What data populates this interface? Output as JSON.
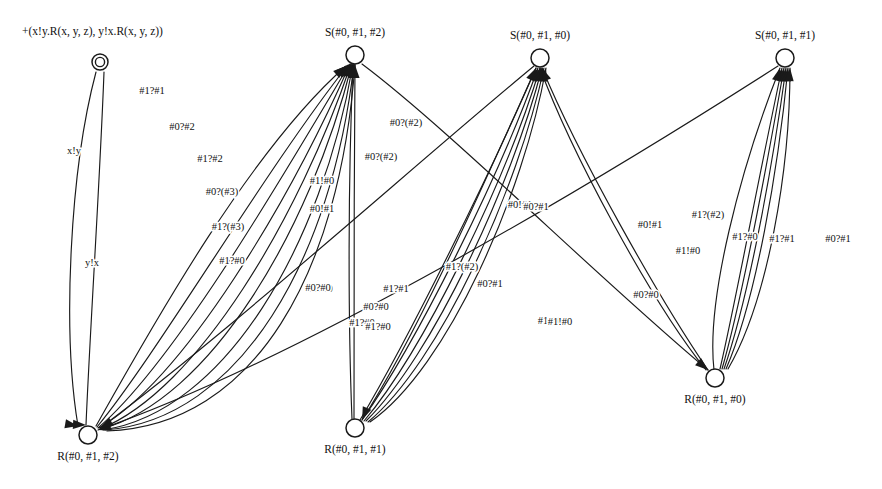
{
  "figure": {
    "type": "state-transition-diagram",
    "width": 882,
    "height": 489,
    "background_color": "#ffffff",
    "stroke_color": "#1a1a1a",
    "text_color": "#111111"
  },
  "formula": {
    "text": "+(x!y.R(x, y, z), y!x.R(x, y, z))",
    "x": 22,
    "y": 32
  },
  "nodes": [
    {
      "id": "init",
      "label": "",
      "x": 100,
      "y": 62,
      "r": 8,
      "double": true,
      "label_dx": 0,
      "label_dy": 0
    },
    {
      "id": "S012",
      "label": "S(#0, #1, #2)",
      "x": 355,
      "y": 55,
      "r": 9,
      "double": false,
      "label_dx": 0,
      "label_dy": -22
    },
    {
      "id": "S010",
      "label": "S(#0, #1, #0)",
      "x": 540,
      "y": 58,
      "r": 9,
      "double": false,
      "label_dx": 0,
      "label_dy": -22
    },
    {
      "id": "S011",
      "label": "S(#0, #1, #1)",
      "x": 785,
      "y": 58,
      "r": 9,
      "double": false,
      "label_dx": 0,
      "label_dy": -22
    },
    {
      "id": "R012",
      "label": "R(#0, #1, #2)",
      "x": 88,
      "y": 435,
      "r": 9,
      "double": false,
      "label_dx": 0,
      "label_dy": 22
    },
    {
      "id": "R011",
      "label": "R(#0, #1, #1)",
      "x": 355,
      "y": 428,
      "r": 9,
      "double": false,
      "label_dx": 0,
      "label_dy": 22
    },
    {
      "id": "R010",
      "label": "R(#0, #1, #0)",
      "x": 715,
      "y": 378,
      "r": 9,
      "double": false,
      "label_dx": 0,
      "label_dy": 22
    }
  ],
  "edges": [
    {
      "from": "init",
      "to": "R012",
      "label": "x!y",
      "d": "M 96 72 C 70 170, 62 330, 78 426",
      "lx": 74,
      "ly": 152,
      "arrow": [
        78,
        426,
        0.18
      ]
    },
    {
      "from": "init",
      "to": "R012",
      "label": "y!x",
      "d": "M 104 72 C 100 180, 90 330, 86 425",
      "lx": 92,
      "ly": 264,
      "arrow": [
        86,
        425,
        0.05
      ]
    },
    {
      "from": "R012",
      "to": "S012",
      "label": "#1?#1",
      "d": "M 96 426 C 150 330, 250 150, 346 66",
      "lx": 152,
      "ly": 92,
      "arrow": [
        346,
        66,
        -0.72
      ]
    },
    {
      "from": "R012",
      "to": "S012",
      "label": "#0?#2",
      "d": "M 97 427 C 160 350, 265 170, 348 65",
      "lx": 182,
      "ly": 128,
      "arrow": [
        348,
        65,
        -0.75
      ]
    },
    {
      "from": "R012",
      "to": "S012",
      "label": "#1?#2",
      "d": "M 98 428 C 172 365, 278 185, 349 65",
      "lx": 210,
      "ly": 160,
      "arrow": [
        349,
        65,
        -0.78
      ]
    },
    {
      "from": "R012",
      "to": "S012",
      "label": "#0?(#3)",
      "d": "M 99 428 C 185 378, 290 200, 350 64",
      "lx": 222,
      "ly": 193,
      "arrow": [
        350,
        64,
        -0.8
      ]
    },
    {
      "from": "R012",
      "to": "S012",
      "label": "#1?(#3)",
      "d": "M 100 429 C 198 390, 300 215, 351 64",
      "lx": 228,
      "ly": 228,
      "arrow": [
        351,
        64,
        -0.82
      ]
    },
    {
      "from": "R012",
      "to": "S012",
      "label": "#1?#0",
      "d": "M 101 429 C 210 400, 310 230, 352 64",
      "lx": 232,
      "ly": 262,
      "arrow": [
        352,
        64,
        -0.85
      ]
    },
    {
      "from": "R012",
      "to": "S012",
      "label": "#1!#0",
      "d": "M 103 430 C 225 412, 322 245, 353 64",
      "lx": 322,
      "ly": 182,
      "arrow": [
        353,
        64,
        -0.88
      ]
    },
    {
      "from": "R012",
      "to": "S012",
      "label": "#0!#1",
      "d": "M 105 430 C 240 420, 332 258, 354 64",
      "lx": 322,
      "ly": 210,
      "arrow": [
        354,
        64,
        -0.92
      ]
    },
    {
      "from": "R012",
      "to": "S012",
      "label": "#0?#0",
      "d": "M 107 431 C 255 426, 340 272, 355 64",
      "lx": 320,
      "ly": 290,
      "arrow": [
        355,
        64,
        -0.98
      ]
    },
    {
      "from": "R011",
      "to": "S012",
      "label": "#0?(#2)",
      "d": "M 354 419 C 354 320, 354 180, 355 65",
      "lx": 406,
      "ly": 124,
      "arrow": [
        355,
        65,
        -1.57
      ]
    },
    {
      "from": "R011",
      "to": "S012",
      "label": "#0?(#2)",
      "d": "M 352 419 C 348 320, 348 180, 353 65",
      "lx": 381,
      "ly": 158,
      "arrow": [
        353,
        65,
        -1.55
      ]
    },
    {
      "from": "R011",
      "to": "S010",
      "label": "#0!#1",
      "d": "M 360 420 C 408 340, 492 170, 536 68",
      "lx": 520,
      "ly": 206,
      "arrow": [
        536,
        68,
        -1.13
      ]
    },
    {
      "from": "R011",
      "to": "S010",
      "label": "#0?#1",
      "d": "M 362 420 C 416 344, 500 175, 538 68",
      "lx": 490,
      "ly": 285,
      "arrow": [
        538,
        68,
        -1.16
      ]
    },
    {
      "from": "R011",
      "to": "S010",
      "label": "#1?(#2)",
      "d": "M 364 421 C 424 350, 506 180, 540 68",
      "lx": 462,
      "ly": 268,
      "arrow": [
        540,
        68,
        -1.2
      ]
    },
    {
      "from": "R011",
      "to": "S010",
      "label": "#1?#1",
      "d": "M 366 421 C 432 356, 512 184, 542 68",
      "lx": 396,
      "ly": 290,
      "arrow": [
        542,
        68,
        -1.24
      ]
    },
    {
      "from": "R011",
      "to": "S010",
      "label": "#0?#0",
      "d": "M 368 422 C 440 362, 518 188, 544 68",
      "lx": 376,
      "ly": 308,
      "arrow": [
        544,
        68,
        -1.28
      ]
    },
    {
      "from": "R011",
      "to": "S010",
      "label": "#1?#0",
      "d": "M 370 422 C 448 368, 524 192, 546 68",
      "lx": 362,
      "ly": 324,
      "arrow": [
        546,
        68,
        -1.32
      ]
    },
    {
      "from": "R010",
      "to": "S010",
      "label": "#1!#0",
      "d": "M 706 370 C 650 300, 570 150, 540 68",
      "lx": 550,
      "ly": 322,
      "arrow": [
        540,
        68,
        -1.9
      ]
    },
    {
      "from": "R010",
      "to": "S010",
      "label": "#0!#1",
      "d": "M 708 370 C 660 300, 578 155, 542 68",
      "lx": 650,
      "ly": 226,
      "arrow": [
        542,
        68,
        -1.94
      ]
    },
    {
      "from": "R010",
      "to": "S011",
      "label": "#1?(#2)",
      "d": "M 720 369 C 736 300, 760 170, 782 68",
      "lx": 708,
      "ly": 216,
      "arrow": [
        782,
        68,
        -1.35
      ]
    },
    {
      "from": "R010",
      "to": "S011",
      "label": "#1!#0",
      "d": "M 722 369 C 742 300, 766 170, 784 68",
      "lx": 688,
      "ly": 252,
      "arrow": [
        784,
        68,
        -1.38
      ]
    },
    {
      "from": "R010",
      "to": "S011",
      "label": "#1?#0",
      "d": "M 724 369 C 748 300, 772 170, 786 68",
      "lx": 745,
      "ly": 238,
      "arrow": [
        786,
        68,
        -1.42
      ]
    },
    {
      "from": "R010",
      "to": "S011",
      "label": "#1?#1",
      "d": "M 726 369 C 756 300, 778 170, 788 68",
      "lx": 782,
      "ly": 240,
      "arrow": [
        788,
        68,
        -1.46
      ]
    },
    {
      "from": "R010",
      "to": "S011",
      "label": "#0?#1",
      "d": "M 728 369 C 768 300, 790 170, 790 68",
      "lx": 838,
      "ly": 240,
      "arrow": [
        790,
        68,
        -1.5
      ]
    },
    {
      "from": "R010",
      "to": "S011",
      "label": "#0?#0",
      "d": "M 714 370 C 706 300, 740 170, 780 68",
      "lx": 646,
      "ly": 296,
      "arrow": [
        780,
        68,
        -1.3
      ]
    },
    {
      "from": "S012",
      "to": "R010",
      "label": "#0?#1",
      "d": "M 362 64 C 450 130, 600 280, 708 370",
      "lx": 536,
      "ly": 208,
      "arrow": [
        708,
        370,
        0.7
      ]
    },
    {
      "from": "S011",
      "to": "R012",
      "label": "#1!#0",
      "d": "M 778 66 C 600 180, 300 360, 98 430",
      "lx": 560,
      "ly": 323,
      "arrow": [
        98,
        430,
        2.86
      ]
    },
    {
      "from": "S010",
      "to": "R012",
      "label": "#0?#0",
      "d": "M 534 66 C 420 160, 220 340, 100 428",
      "lx": 318,
      "ly": 289,
      "arrow": [
        100,
        428,
        2.63
      ]
    },
    {
      "from": "S010",
      "to": "R011",
      "label": "#1?#0",
      "d": "M 536 68 C 490 170, 420 330, 362 420",
      "lx": 378,
      "ly": 328,
      "arrow": [
        362,
        420,
        1.97
      ]
    }
  ]
}
